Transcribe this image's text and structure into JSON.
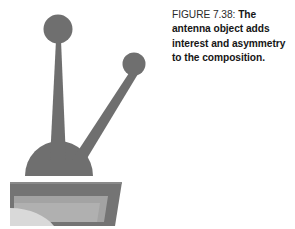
{
  "figure": {
    "caption_label": "FIGURE 7.38:",
    "caption_text": "The antenna object adds interest and asymmetry to the composition.",
    "caption_full": "FIGURE 7.38: The antenna object adds interest and asymmetry to the composition.",
    "caption_lines": [
      "FIGURE 7.38: The antenna",
      "object adds interest and",
      "asymmetry to the",
      "composition."
    ]
  },
  "illustration": {
    "title": "antenna-object",
    "description": "Gray silhouette of an antenna: a tall tapered mast topped by a large disc, a shorter angled arm topped by a smaller disc, both rising from a semicircular dome that sits on a trapezoidal base.",
    "colors": {
      "background": "#ffffff",
      "antenna_gray": "#6f6f6f",
      "base_dark_gray": "#747474",
      "base_mid_gray": "#9e9e9e",
      "base_light_gray": "#b4b4b4",
      "base_highlight_gray": "#d9d9d9",
      "base_edge_gray": "#5f5f5f"
    },
    "parts": [
      {
        "name": "large-dish",
        "shape": "circle",
        "cx": 58,
        "cy": 29,
        "r": 14
      },
      {
        "name": "small-dish",
        "shape": "circle",
        "cx": 134,
        "cy": 64,
        "r": 11
      },
      {
        "name": "main-mast",
        "shape": "tapered-column"
      },
      {
        "name": "angled-arm",
        "shape": "tapered-arm"
      },
      {
        "name": "dome",
        "shape": "semicircle"
      },
      {
        "name": "base-slab",
        "shape": "trapezoid"
      }
    ]
  }
}
